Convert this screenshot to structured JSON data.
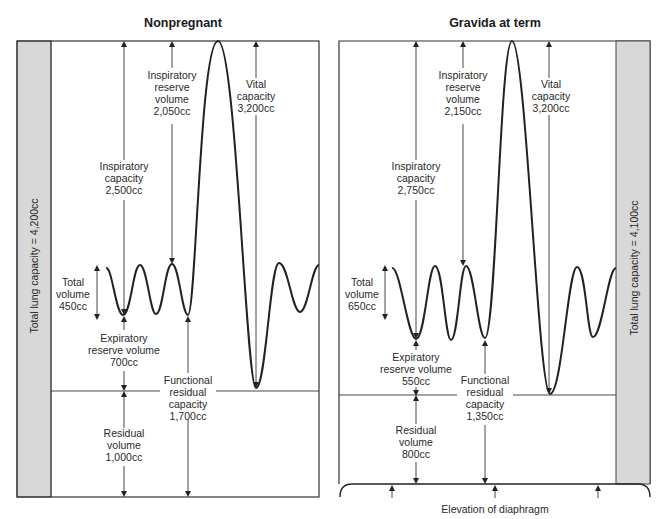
{
  "panels": {
    "nonpregnant": {
      "title": "Nonpregnant",
      "total_lung_capacity": "Total lung capacity = 4,200cc",
      "inspiratory_reserve_volume": [
        "Inspiratory",
        "reserve",
        "volume",
        "2,050cc"
      ],
      "vital_capacity": [
        "Vital",
        "capacity",
        "3,200cc"
      ],
      "inspiratory_capacity": [
        "Inspiratory",
        "capacity",
        "2,500cc"
      ],
      "tidal_volume": [
        "Total",
        "volume",
        "450cc"
      ],
      "expiratory_reserve_volume": [
        "Expiratory",
        "reserve volume",
        "700cc"
      ],
      "functional_residual_capacity": [
        "Functional",
        "residual",
        "capacity",
        "1,700cc"
      ],
      "residual_volume": [
        "Residual",
        "volume",
        "1,000cc"
      ]
    },
    "gravida": {
      "title": "Gravida at term",
      "total_lung_capacity": "Total lung capacity = 4,100cc",
      "inspiratory_reserve_volume": [
        "Inspiratory",
        "reserve",
        "volume",
        "2,150cc"
      ],
      "vital_capacity": [
        "Vital",
        "capacity",
        "3,200cc"
      ],
      "inspiratory_capacity": [
        "Inspiratory",
        "capacity",
        "2,750cc"
      ],
      "tidal_volume": [
        "Total",
        "volume",
        "650cc"
      ],
      "expiratory_reserve_volume": [
        "Expiratory",
        "reserve volume",
        "550cc"
      ],
      "functional_residual_capacity": [
        "Functional",
        "residual",
        "capacity",
        "1,350cc"
      ],
      "residual_volume": [
        "Residual",
        "volume",
        "800cc"
      ],
      "diaphragm_label": "Elevation of diaphragm"
    }
  },
  "colors": {
    "band": "#d8d8d8",
    "line": "#222222",
    "background": "#ffffff"
  }
}
